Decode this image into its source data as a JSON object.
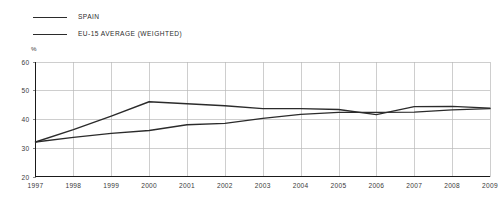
{
  "legend": {
    "position": "top-left",
    "items": [
      {
        "label": "SPAIN",
        "color": "#2b2b2b",
        "icon": "line-swatch-icon"
      },
      {
        "label": "EU-15 AVERAGE (WEIGHTED)",
        "color": "#2b2b2b",
        "icon": "line-swatch-icon"
      }
    ]
  },
  "axis": {
    "unit_label": "%",
    "y_ticks": [
      "60",
      "50",
      "40",
      "30",
      "20"
    ],
    "x_ticks": [
      "1997",
      "1998",
      "1999",
      "2000",
      "2001",
      "2002",
      "2003",
      "2004",
      "2005",
      "2006",
      "2007",
      "2008",
      "2009"
    ]
  },
  "chart_data": {
    "type": "line",
    "title": "",
    "subtitle": "",
    "xlabel": "",
    "ylabel": "%",
    "ylim": [
      20,
      60
    ],
    "ytick_step": 10,
    "grid": true,
    "legend_position": "top-left",
    "x": [
      1997,
      1998,
      1999,
      2000,
      2001,
      2002,
      2003,
      2004,
      2005,
      2006,
      2007,
      2008,
      2009
    ],
    "categories": [
      "1997",
      "1998",
      "1999",
      "2000",
      "2001",
      "2002",
      "2003",
      "2004",
      "2005",
      "2006",
      "2007",
      "2008",
      "2009"
    ],
    "series": [
      {
        "name": "SPAIN",
        "color": "#2b2b2b",
        "values": [
          32.0,
          36.3,
          41.0,
          46.0,
          45.3,
          44.6,
          43.6,
          43.6,
          43.3,
          41.5,
          44.3,
          44.4,
          43.8
        ]
      },
      {
        "name": "EU-15 AVERAGE (WEIGHTED)",
        "color": "#2b2b2b",
        "values": [
          32.0,
          33.6,
          35.0,
          36.0,
          38.0,
          38.5,
          40.2,
          41.6,
          42.3,
          42.3,
          42.4,
          43.2,
          43.6
        ]
      }
    ]
  }
}
